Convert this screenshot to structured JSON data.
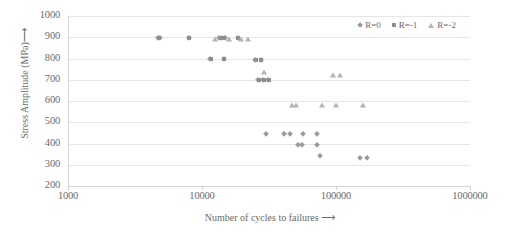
{
  "chart_data": {
    "type": "scatter",
    "title": "",
    "xlabel": "Number of cycles to failures  ⟶",
    "ylabel": "Stress Amplitude (MPa)⟶",
    "xscale": "log",
    "xlim": [
      1000,
      1000000
    ],
    "ylim": [
      200,
      1000
    ],
    "xticks": [
      1000,
      10000,
      100000,
      1000000
    ],
    "xtick_labels": [
      "1000",
      "10000",
      "100000",
      "1000000"
    ],
    "yticks": [
      200,
      300,
      400,
      500,
      600,
      700,
      800,
      900,
      1000
    ],
    "ytick_labels": [
      "200",
      "300",
      "400",
      "500",
      "600",
      "700",
      "800",
      "900",
      "1000"
    ],
    "grid": "horizontal",
    "legend_position": "top-right",
    "series": [
      {
        "name": "R=0",
        "marker": "diamond",
        "color": "#9a9a9a",
        "points": [
          [
            4700,
            897
          ],
          [
            4900,
            897
          ],
          [
            8000,
            896
          ],
          [
            13500,
            897
          ],
          [
            14000,
            897
          ],
          [
            14800,
            897
          ],
          [
            18500,
            897
          ],
          [
            11500,
            797
          ],
          [
            14500,
            797
          ],
          [
            25000,
            795
          ],
          [
            27500,
            795
          ],
          [
            26000,
            700
          ],
          [
            28500,
            700
          ],
          [
            31000,
            700
          ],
          [
            30000,
            445
          ],
          [
            41000,
            443
          ],
          [
            45000,
            443
          ],
          [
            57000,
            443
          ],
          [
            72000,
            443
          ],
          [
            52000,
            393
          ],
          [
            56000,
            393
          ],
          [
            72000,
            395
          ],
          [
            76000,
            340
          ],
          [
            150000,
            333
          ],
          [
            170000,
            333
          ]
        ]
      },
      {
        "name": "R=-1",
        "marker": "square",
        "color": "#8f8f8f",
        "points": [
          [
            4800,
            897
          ],
          [
            8000,
            896
          ],
          [
            13800,
            897
          ],
          [
            14500,
            897
          ],
          [
            18600,
            897
          ],
          [
            11600,
            797
          ],
          [
            14600,
            797
          ],
          [
            25500,
            795
          ],
          [
            27500,
            795
          ],
          [
            26500,
            700
          ],
          [
            29000,
            700
          ],
          [
            31500,
            700
          ]
        ]
      },
      {
        "name": "R=-2",
        "marker": "triangle",
        "color": "#b4b4b4",
        "points": [
          [
            12500,
            893
          ],
          [
            15800,
            893
          ],
          [
            19500,
            893
          ],
          [
            22000,
            893
          ],
          [
            29000,
            735
          ],
          [
            95000,
            722
          ],
          [
            108000,
            722
          ],
          [
            50000,
            583
          ],
          [
            78000,
            580
          ],
          [
            100000,
            580
          ],
          [
            160000,
            580
          ],
          [
            47000,
            583
          ]
        ]
      }
    ]
  },
  "axis": {
    "y_title": "Stress Amplitude (MPa)⟶",
    "x_title": "Number of cycles to failures  ⟶"
  },
  "legend": {
    "items": [
      {
        "label": "R=0",
        "marker": "diamond"
      },
      {
        "label": "R=-1",
        "marker": "square"
      },
      {
        "label": "R=-2",
        "marker": "triangle"
      }
    ]
  }
}
